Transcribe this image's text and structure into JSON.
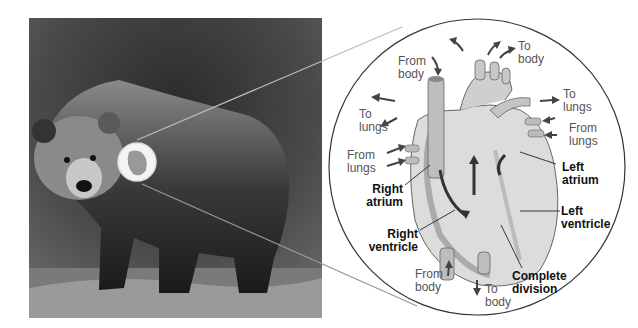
{
  "figure": {
    "photo_subject": "Brown bear standing on grass",
    "inset_subject": "Mammalian four-chambered heart"
  },
  "labels": {
    "from_body_top": [
      "From",
      "body"
    ],
    "to_body_top": [
      "To",
      "body"
    ],
    "to_lungs_left": [
      "To",
      "lungs"
    ],
    "to_lungs_right": [
      "To",
      "lungs"
    ],
    "from_lungs_left": [
      "From",
      "lungs"
    ],
    "from_lungs_right": [
      "From",
      "lungs"
    ],
    "right_atrium": [
      "Right",
      "atrium"
    ],
    "left_atrium": [
      "Left",
      "atrium"
    ],
    "right_ventricle": [
      "Right",
      "ventricle"
    ],
    "left_ventricle": [
      "Left",
      "ventricle"
    ],
    "from_body_bottom": [
      "From",
      "body"
    ],
    "to_body_bottom": [
      "To",
      "body"
    ],
    "complete_division": [
      "Complete",
      "division"
    ]
  },
  "colors": {
    "flow_arrow": "#444444",
    "label_gray": "#555555",
    "label_bold": "#111111",
    "callout_line": "#999999"
  }
}
